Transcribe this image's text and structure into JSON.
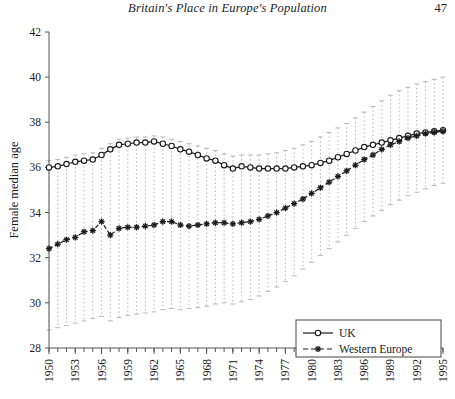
{
  "header": {
    "title": "Britain's Place in Europe's Population",
    "page_number": "47"
  },
  "figure": {
    "y_axis_label": "Female median age",
    "x_axis_label": "",
    "legend": {
      "items": [
        {
          "label": "UK",
          "marker": "open-circle",
          "line": "solid"
        },
        {
          "label": "Western Europe",
          "marker": "asterisk",
          "line": "dashed"
        }
      ]
    }
  },
  "chart_data": {
    "type": "line",
    "title": "",
    "xlabel": "",
    "ylabel": "Female median age",
    "xlim": [
      1950,
      1995
    ],
    "ylim": [
      28,
      42
    ],
    "yticks": [
      28,
      30,
      32,
      34,
      36,
      38,
      40,
      42
    ],
    "xticks": [
      1950,
      1953,
      1956,
      1959,
      1962,
      1965,
      1968,
      1971,
      1974,
      1977,
      1980,
      1983,
      1986,
      1989,
      1992,
      1995
    ],
    "xtick_minor_step": 1,
    "grid": false,
    "legend_position": "bottom-right",
    "x": [
      1950,
      1951,
      1952,
      1953,
      1954,
      1955,
      1956,
      1957,
      1958,
      1959,
      1960,
      1961,
      1962,
      1963,
      1964,
      1965,
      1966,
      1967,
      1968,
      1969,
      1970,
      1971,
      1972,
      1973,
      1974,
      1975,
      1976,
      1977,
      1978,
      1979,
      1980,
      1981,
      1982,
      1983,
      1984,
      1985,
      1986,
      1987,
      1988,
      1989,
      1990,
      1991,
      1992,
      1993,
      1994,
      1995
    ],
    "series": [
      {
        "name": "UK",
        "marker": "open-circle",
        "line": "solid",
        "color": "#1a1a1a",
        "values": [
          36.0,
          36.05,
          36.15,
          36.25,
          36.3,
          36.35,
          36.55,
          36.8,
          37.0,
          37.05,
          37.1,
          37.1,
          37.15,
          37.05,
          36.95,
          36.8,
          36.7,
          36.55,
          36.4,
          36.3,
          36.1,
          35.95,
          36.05,
          36.0,
          35.95,
          35.95,
          35.95,
          35.95,
          36.0,
          36.05,
          36.1,
          36.2,
          36.3,
          36.45,
          36.6,
          36.75,
          36.9,
          37.0,
          37.1,
          37.2,
          37.3,
          37.4,
          37.5,
          37.55,
          37.6,
          37.65
        ]
      },
      {
        "name": "Western Europe",
        "marker": "asterisk",
        "line": "dashed",
        "color": "#1a1a1a",
        "values": [
          32.4,
          32.6,
          32.8,
          32.9,
          33.15,
          33.2,
          33.6,
          33.0,
          33.3,
          33.35,
          33.35,
          33.4,
          33.45,
          33.6,
          33.6,
          33.45,
          33.4,
          33.45,
          33.5,
          33.55,
          33.55,
          33.5,
          33.55,
          33.6,
          33.7,
          33.85,
          34.0,
          34.2,
          34.4,
          34.6,
          34.85,
          35.1,
          35.35,
          35.6,
          35.85,
          36.1,
          36.35,
          36.55,
          36.8,
          37.0,
          37.15,
          37.3,
          37.4,
          37.5,
          37.55,
          37.6
        ]
      }
    ],
    "range_bars": {
      "style": "dotted-vertical-with-caps",
      "color": "#b9b9b9",
      "lower": [
        28.8,
        28.9,
        29.0,
        29.1,
        29.2,
        29.3,
        29.4,
        29.2,
        29.35,
        29.45,
        29.5,
        29.55,
        29.6,
        29.7,
        29.75,
        29.7,
        29.75,
        29.8,
        29.85,
        29.95,
        30.0,
        29.95,
        30.05,
        30.15,
        30.3,
        30.5,
        30.7,
        30.95,
        31.2,
        31.5,
        31.8,
        32.1,
        32.4,
        32.7,
        33.0,
        33.3,
        33.6,
        33.85,
        34.1,
        34.35,
        34.55,
        34.75,
        34.9,
        35.05,
        35.2,
        35.3
      ],
      "upper": [
        36.3,
        36.35,
        36.45,
        36.55,
        36.6,
        36.65,
        36.85,
        37.05,
        37.25,
        37.3,
        37.35,
        37.35,
        37.4,
        37.35,
        37.25,
        37.15,
        37.05,
        36.95,
        36.85,
        36.75,
        36.6,
        36.5,
        36.55,
        36.55,
        36.55,
        36.6,
        36.65,
        36.75,
        36.85,
        37.0,
        37.15,
        37.35,
        37.55,
        37.75,
        37.95,
        38.2,
        38.45,
        38.7,
        38.95,
        39.2,
        39.4,
        39.55,
        39.7,
        39.8,
        39.9,
        40.0
      ]
    }
  }
}
